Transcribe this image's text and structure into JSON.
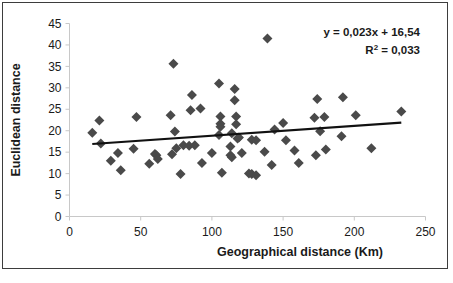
{
  "figure": {
    "frame_color": "#3d3d3d",
    "background": "#ffffff"
  },
  "chart_data": {
    "type": "scatter",
    "title": "",
    "subtitle": "",
    "xlabel": "Geographical distance (Km)",
    "ylabel": "Euclidean distance",
    "xlim": [
      0,
      250
    ],
    "ylim": [
      0,
      45
    ],
    "xticks": [
      0,
      50,
      100,
      150,
      200,
      250
    ],
    "yticks": [
      0,
      5,
      10,
      15,
      20,
      25,
      30,
      35,
      40,
      45
    ],
    "xtick_labels": [
      "0",
      "50",
      "100",
      "150",
      "200",
      "250"
    ],
    "ytick_labels": [
      "0",
      "5",
      "10",
      "15",
      "20",
      "25",
      "30",
      "35",
      "40",
      "45"
    ],
    "grid": false,
    "legend": null,
    "marker": {
      "shape": "diamond",
      "color": "#4a4a4a",
      "size": 5
    },
    "annotations": [
      {
        "name": "regression-equation",
        "text": "y = 0,023x + 16,54"
      },
      {
        "name": "r-squared",
        "text_prefix": "R",
        "text_sup": "2",
        "text_suffix": " = 0,033"
      }
    ],
    "trendline": {
      "type": "linear",
      "slope": 0.023,
      "intercept": 16.54,
      "color": "#111111",
      "width": 2.2,
      "x_start": 16,
      "x_end": 233
    },
    "points": [
      {
        "x": 16,
        "y": 19.5
      },
      {
        "x": 21,
        "y": 22.4
      },
      {
        "x": 22,
        "y": 17.0
      },
      {
        "x": 29,
        "y": 13.0
      },
      {
        "x": 34,
        "y": 14.8
      },
      {
        "x": 36,
        "y": 10.8
      },
      {
        "x": 45,
        "y": 15.8
      },
      {
        "x": 47,
        "y": 23.2
      },
      {
        "x": 56,
        "y": 12.3
      },
      {
        "x": 60,
        "y": 14.6
      },
      {
        "x": 61,
        "y": 14.3
      },
      {
        "x": 62,
        "y": 13.4
      },
      {
        "x": 71,
        "y": 23.6
      },
      {
        "x": 72,
        "y": 14.5
      },
      {
        "x": 73,
        "y": 35.6
      },
      {
        "x": 74,
        "y": 19.8
      },
      {
        "x": 75,
        "y": 15.9
      },
      {
        "x": 78,
        "y": 9.9
      },
      {
        "x": 80,
        "y": 16.6
      },
      {
        "x": 84,
        "y": 16.5
      },
      {
        "x": 85,
        "y": 24.8
      },
      {
        "x": 86,
        "y": 28.3
      },
      {
        "x": 88,
        "y": 16.6
      },
      {
        "x": 92,
        "y": 25.2
      },
      {
        "x": 93,
        "y": 12.5
      },
      {
        "x": 100,
        "y": 14.8
      },
      {
        "x": 105,
        "y": 31.0
      },
      {
        "x": 105,
        "y": 19.0
      },
      {
        "x": 106,
        "y": 23.3
      },
      {
        "x": 106,
        "y": 21.6
      },
      {
        "x": 106,
        "y": 20.9
      },
      {
        "x": 107,
        "y": 10.2
      },
      {
        "x": 113,
        "y": 16.3
      },
      {
        "x": 113,
        "y": 14.3
      },
      {
        "x": 114,
        "y": 13.8
      },
      {
        "x": 114,
        "y": 19.4
      },
      {
        "x": 116,
        "y": 29.7
      },
      {
        "x": 116,
        "y": 27.1
      },
      {
        "x": 117,
        "y": 23.3
      },
      {
        "x": 117,
        "y": 21.5
      },
      {
        "x": 118,
        "y": 18.2
      },
      {
        "x": 119,
        "y": 18.4
      },
      {
        "x": 121,
        "y": 14.8
      },
      {
        "x": 126,
        "y": 10.0
      },
      {
        "x": 128,
        "y": 17.9
      },
      {
        "x": 128,
        "y": 9.9
      },
      {
        "x": 131,
        "y": 17.8
      },
      {
        "x": 131,
        "y": 9.6
      },
      {
        "x": 137,
        "y": 15.1
      },
      {
        "x": 139,
        "y": 41.5
      },
      {
        "x": 142,
        "y": 12.0
      },
      {
        "x": 144,
        "y": 20.3
      },
      {
        "x": 150,
        "y": 21.8
      },
      {
        "x": 152,
        "y": 17.8
      },
      {
        "x": 158,
        "y": 15.4
      },
      {
        "x": 161,
        "y": 12.5
      },
      {
        "x": 172,
        "y": 23.0
      },
      {
        "x": 173,
        "y": 14.3
      },
      {
        "x": 174,
        "y": 27.4
      },
      {
        "x": 176,
        "y": 19.9
      },
      {
        "x": 179,
        "y": 23.2
      },
      {
        "x": 180,
        "y": 15.6
      },
      {
        "x": 191,
        "y": 18.7
      },
      {
        "x": 192,
        "y": 27.8
      },
      {
        "x": 201,
        "y": 23.6
      },
      {
        "x": 212,
        "y": 15.9
      },
      {
        "x": 233,
        "y": 24.5
      }
    ]
  }
}
